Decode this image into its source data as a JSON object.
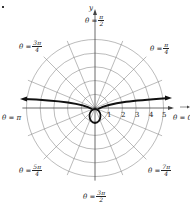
{
  "figure": {
    "type": "polar graph",
    "center": [
      95,
      108
    ],
    "ring_spacing_px": 13.7,
    "rings": [
      1,
      2,
      3,
      4,
      5
    ],
    "radial_divisions": 16,
    "axis_labels": {
      "y": "y",
      "x_direction": "θ = 0"
    },
    "tick_labels": [
      "1",
      "2",
      "3",
      "4",
      "5"
    ],
    "angle_labels": [
      {
        "id": "half_pi",
        "prefix": "θ =",
        "num": "π",
        "den": "2"
      },
      {
        "id": "quarter_pi",
        "prefix": "θ =",
        "num": "π",
        "den": "4"
      },
      {
        "id": "three_quarter_pi",
        "prefix": "θ =",
        "num": "3π",
        "den": "4"
      },
      {
        "id": "pi",
        "prefix": "θ = π",
        "num": "",
        "den": ""
      },
      {
        "id": "zero",
        "prefix": "θ = 0",
        "num": "",
        "den": ""
      },
      {
        "id": "five_quarter_pi",
        "prefix": "θ =",
        "num": "5π",
        "den": "4"
      },
      {
        "id": "seven_quarter_pi",
        "prefix": "θ =",
        "num": "7π",
        "den": "4"
      },
      {
        "id": "three_half_pi",
        "prefix": "θ =",
        "num": "3π",
        "den": "2"
      }
    ],
    "curve": {
      "description": "conchoid-shaped polar curve with two branches approaching horizontal asymptote and small loop below pole",
      "color": "#111111"
    },
    "grid_color": "#777777"
  }
}
